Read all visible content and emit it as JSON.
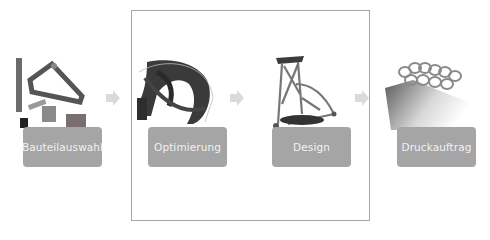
{
  "diagram": {
    "type": "process-flow",
    "highlight_box": {
      "contains": [
        "Optimierung",
        "Design"
      ],
      "border_color": "#a6a6a6"
    },
    "steps": [
      {
        "label": "Bauteilauswahl",
        "image": "bracket-parts-assembly-image"
      },
      {
        "label": "Optimierung",
        "image": "topology-optimized-bracket-image"
      },
      {
        "label": "Design",
        "image": "lattice-truss-design-image"
      },
      {
        "label": "Druckauftrag",
        "image": "3d-print-build-plate-image"
      }
    ],
    "connectors": [
      "arrow-right",
      "arrow-right",
      "arrow-right"
    ],
    "colors": {
      "label_bg": "#a5a5a5",
      "label_text": "#f2f2f2",
      "arrow": "#dadada"
    }
  }
}
